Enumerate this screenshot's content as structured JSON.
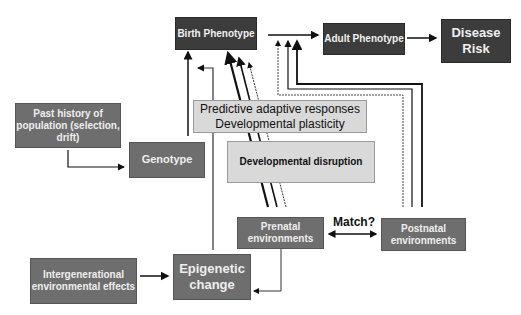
{
  "diagram": {
    "nodes": {
      "birth_phenotype": "Birth Phenotype",
      "adult_phenotype": "Adult Phenotype",
      "disease_risk": "Disease Risk",
      "past_history": "Past history of population (selection, drift)",
      "genotype": "Genotype",
      "predictive_line1": "Predictive adaptive responses",
      "predictive_line2": "Developmental plasticity",
      "developmental_disruption": "Developmental disruption",
      "prenatal": "Prenatal environments",
      "postnatal": "Postnatal environments",
      "intergenerational": "Intergenerational environmental effects",
      "epigenetic": "Epigenetic change"
    },
    "edge_labels": {
      "match": "Match?"
    },
    "colors": {
      "dark_box": "#3c3c3c",
      "mid_box": "#6e6e6e",
      "light_box": "#d9d9d9",
      "line": "#111111"
    }
  }
}
